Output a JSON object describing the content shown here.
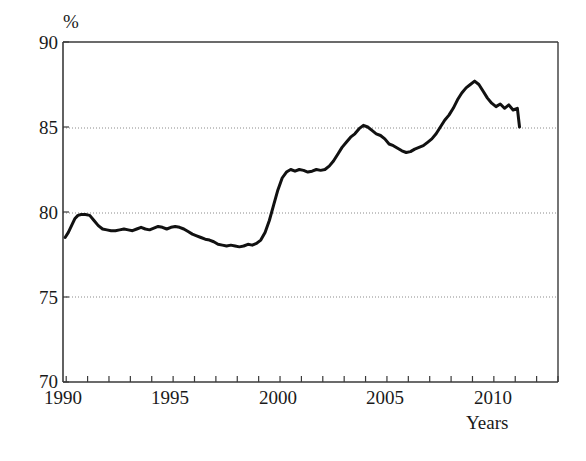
{
  "chart_data": {
    "type": "line",
    "title": "",
    "subtitle": "",
    "xlabel": "Years",
    "ylabel": "%",
    "ylim": [
      70,
      90
    ],
    "xlim": [
      1989.85,
      2013.0
    ],
    "grid": "horizontal dotted gridlines at 75, 80, 85",
    "legend": "none",
    "y_ticks": [
      70,
      75,
      80,
      85,
      90
    ],
    "y_tick_labels": [
      "70",
      "75",
      "80",
      "85",
      "90"
    ],
    "x_ticks": [
      1990,
      1991,
      1992,
      1993,
      1994,
      1995,
      1996,
      1997,
      1998,
      1999,
      2000,
      2001,
      2002,
      2003,
      2004,
      2005,
      2006,
      2007,
      2008,
      2009,
      2010,
      2011,
      2012,
      2013
    ],
    "x_tick_labels_shown": [
      "1990",
      "1995",
      "2000",
      "2005",
      "2010"
    ],
    "x_tick_labels_shown_at": [
      1990,
      1995,
      2000,
      2005,
      2010
    ],
    "series": [
      {
        "name": "percent",
        "color": "#111111",
        "line_width": 3,
        "x": [
          1989.95,
          1990.1,
          1990.25,
          1990.4,
          1990.55,
          1990.7,
          1990.9,
          1991.1,
          1991.3,
          1991.5,
          1991.7,
          1991.9,
          1992.1,
          1992.3,
          1992.5,
          1992.7,
          1992.9,
          1993.1,
          1993.3,
          1993.5,
          1993.7,
          1993.9,
          1994.1,
          1994.3,
          1994.5,
          1994.7,
          1994.9,
          1995.1,
          1995.3,
          1995.5,
          1995.7,
          1995.9,
          1996.1,
          1996.3,
          1996.5,
          1996.7,
          1996.9,
          1997.1,
          1997.3,
          1997.5,
          1997.7,
          1997.9,
          1998.1,
          1998.3,
          1998.5,
          1998.7,
          1998.9,
          1999.1,
          1999.3,
          1999.5,
          1999.7,
          1999.9,
          2000.1,
          2000.3,
          2000.5,
          2000.7,
          2000.9,
          2001.1,
          2001.3,
          2001.5,
          2001.7,
          2001.9,
          2002.1,
          2002.3,
          2002.5,
          2002.7,
          2002.9,
          2003.1,
          2003.3,
          2003.5,
          2003.7,
          2003.9,
          2004.1,
          2004.3,
          2004.5,
          2004.7,
          2004.9,
          2005.1,
          2005.3,
          2005.5,
          2005.7,
          2005.9,
          2006.1,
          2006.3,
          2006.5,
          2006.7,
          2006.9,
          2007.1,
          2007.3,
          2007.5,
          2007.7,
          2007.9,
          2008.1,
          2008.3,
          2008.5,
          2008.7,
          2008.9,
          2009.1,
          2009.3,
          2009.5,
          2009.7,
          2009.9,
          2010.1,
          2010.3,
          2010.5,
          2010.7,
          2010.9,
          2011.1,
          2011.2
        ],
        "y": [
          78.5,
          78.8,
          79.2,
          79.6,
          79.8,
          79.85,
          79.85,
          79.8,
          79.5,
          79.2,
          79.0,
          78.95,
          78.9,
          78.9,
          78.95,
          79.0,
          78.95,
          78.9,
          79.0,
          79.1,
          79.0,
          78.95,
          79.05,
          79.15,
          79.1,
          79.0,
          79.1,
          79.15,
          79.1,
          79.0,
          78.85,
          78.7,
          78.6,
          78.5,
          78.4,
          78.35,
          78.25,
          78.1,
          78.05,
          78.0,
          78.05,
          78.0,
          77.95,
          78.0,
          78.1,
          78.05,
          78.15,
          78.35,
          78.8,
          79.5,
          80.4,
          81.3,
          82.0,
          82.35,
          82.5,
          82.4,
          82.5,
          82.45,
          82.35,
          82.4,
          82.5,
          82.45,
          82.5,
          82.7,
          83.0,
          83.4,
          83.8,
          84.1,
          84.4,
          84.6,
          84.9,
          85.1,
          85.0,
          84.8,
          84.6,
          84.5,
          84.3,
          84.0,
          83.9,
          83.75,
          83.6,
          83.5,
          83.55,
          83.7,
          83.8,
          83.9,
          84.1,
          84.3,
          84.6,
          85.0,
          85.4,
          85.7,
          86.1,
          86.6,
          87.0,
          87.3,
          87.5,
          87.7,
          87.5,
          87.1,
          86.7,
          86.4,
          86.2,
          86.35,
          86.1,
          86.3,
          86.0,
          86.1,
          85.0
        ]
      }
    ],
    "description_points": {
      "start_1990": 78.5,
      "local_peak_1991": 79.85,
      "trough_1997_1998": 78.0,
      "rise_plateau_2000_2002": 82.5,
      "local_peak_2004": 85.1,
      "dip_2006": 83.5,
      "global_peak_2009": 87.7,
      "end_value": 85.0
    }
  },
  "axes": {
    "y_unit_label": "%",
    "x_axis_title": "Years",
    "y_tick_labels": [
      "90",
      "85",
      "80",
      "75",
      "70"
    ],
    "x_tick_labels": [
      "1990",
      "1995",
      "2000",
      "2005",
      "2010"
    ]
  },
  "colors": {
    "line": "#111111",
    "axis": "#3a3a3a",
    "gridline": "#8a8a8a",
    "background": "#ffffff",
    "text": "#1a1a1a"
  }
}
